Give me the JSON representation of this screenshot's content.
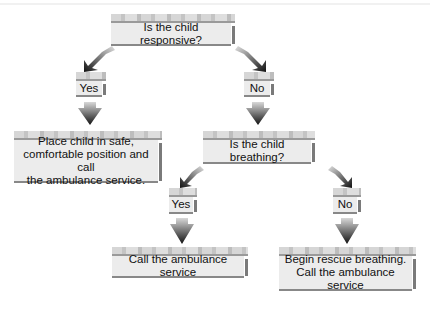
{
  "diagram": {
    "type": "flowchart",
    "nodes": {
      "q1": "Is the child responsive?",
      "yes1": "Yes",
      "no1": "No",
      "a1": "Place child in safe,\ncomfortable position and call\nthe ambulance service.",
      "q2": "Is the child breathing?",
      "yes2": "Yes",
      "no2": "No",
      "a2": "Call the ambulance service",
      "a3": "Begin rescue breathing.\nCall the ambulance service"
    },
    "edges": [
      {
        "from": "q1",
        "to": "yes1"
      },
      {
        "from": "q1",
        "to": "no1"
      },
      {
        "from": "yes1",
        "to": "a1"
      },
      {
        "from": "no1",
        "to": "q2"
      },
      {
        "from": "q2",
        "to": "yes2"
      },
      {
        "from": "q2",
        "to": "no2"
      },
      {
        "from": "yes2",
        "to": "a2"
      },
      {
        "from": "no2",
        "to": "a3"
      }
    ]
  }
}
